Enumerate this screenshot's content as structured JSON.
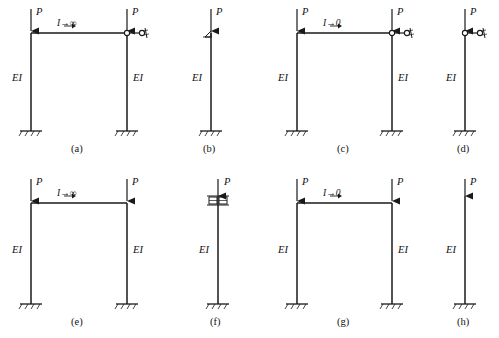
{
  "figure": {
    "title": "",
    "panels": [
      {
        "key": "a",
        "caption": "(a)",
        "type": "portal-frame",
        "beam_label": "I→∞",
        "left_load_label": "P",
        "right_load_label": "P",
        "left_column_label": "EI",
        "right_column_label": "EI",
        "top_right_support": "hinge-roller-link",
        "base_support": "fixed",
        "geometry": {
          "left_col_x": 31,
          "right_col_x": 127,
          "beam_y": 33,
          "base_y": 131,
          "load_arrow_top_y": 8
        }
      },
      {
        "key": "b",
        "caption": "(b)",
        "type": "single-column",
        "beam_label": "",
        "left_load_label": "P",
        "left_column_label": "EI",
        "top_right_support": "pin-triangle",
        "base_support": "fixed",
        "geometry": {
          "left_col_x": 211,
          "beam_y": 33,
          "base_y": 131,
          "load_arrow_top_y": 8
        }
      },
      {
        "key": "c",
        "caption": "(c)",
        "type": "portal-frame",
        "beam_label": "I→0",
        "left_load_label": "P",
        "right_load_label": "P",
        "left_column_label": "EI",
        "right_column_label": "EI",
        "top_right_support": "hinge-roller-link",
        "base_support": "fixed",
        "geometry": {
          "left_col_x": 297,
          "right_col_x": 392,
          "beam_y": 33,
          "base_y": 131,
          "load_arrow_top_y": 8
        }
      },
      {
        "key": "d",
        "caption": "(d)",
        "type": "single-column",
        "beam_label": "",
        "left_load_label": "P",
        "left_column_label": "EI",
        "top_right_support": "hinge-roller-link",
        "base_support": "fixed",
        "geometry": {
          "left_col_x": 465,
          "beam_y": 33,
          "base_y": 131,
          "load_arrow_top_y": 8
        }
      },
      {
        "key": "e",
        "caption": "(e)",
        "type": "portal-frame",
        "beam_label": "I→∞",
        "left_load_label": "P",
        "right_load_label": "P",
        "left_column_label": "EI",
        "right_column_label": "EI",
        "top_right_support": "rigid",
        "base_support": "fixed",
        "geometry": {
          "left_col_x": 31,
          "right_col_x": 127,
          "beam_y": 203,
          "base_y": 304,
          "load_arrow_top_y": 178
        }
      },
      {
        "key": "f",
        "caption": "(f)",
        "type": "single-column",
        "beam_label": "",
        "left_load_label": "P",
        "left_column_label": "EI",
        "top_right_support": "guided-slider",
        "base_support": "fixed",
        "geometry": {
          "left_col_x": 218,
          "beam_y": 203,
          "base_y": 304,
          "load_arrow_top_y": 178
        }
      },
      {
        "key": "g",
        "caption": "(g)",
        "type": "portal-frame",
        "beam_label": "I→0",
        "left_load_label": "P",
        "right_load_label": "P",
        "left_column_label": "EI",
        "right_column_label": "EI",
        "top_right_support": "rigid",
        "base_support": "fixed",
        "geometry": {
          "left_col_x": 297,
          "right_col_x": 392,
          "beam_y": 203,
          "base_y": 304,
          "load_arrow_top_y": 178
        }
      },
      {
        "key": "h",
        "caption": "(h)",
        "type": "single-column",
        "beam_label": "",
        "left_load_label": "P",
        "left_column_label": "EI",
        "top_right_support": "free",
        "base_support": "fixed",
        "geometry": {
          "left_col_x": 465,
          "beam_y": 203,
          "base_y": 304,
          "load_arrow_top_y": 178
        }
      }
    ],
    "captions": {
      "a": "(a)",
      "b": "(b)",
      "c": "(c)",
      "d": "(d)",
      "e": "(e)",
      "f": "(f)",
      "g": "(g)",
      "h": "(h)"
    },
    "labels": {
      "load": "P",
      "stiffness": "EI",
      "beam_rigid": "I→∞",
      "beam_flexible": "I→0"
    },
    "colors": {
      "line": "#1a1a1a",
      "background": "#ffffff"
    }
  }
}
